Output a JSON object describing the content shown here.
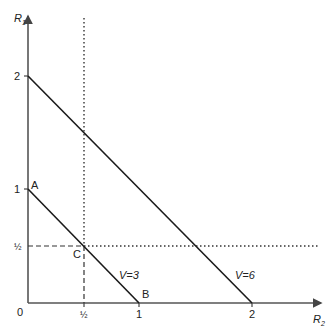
{
  "axes": {
    "y_label": "R",
    "y_label_sub": "1",
    "x_label": "R",
    "x_label_sub": "2",
    "origin_label": "0",
    "y_ticks": [
      {
        "label": "2",
        "value": 2
      },
      {
        "label": "1",
        "value": 1
      },
      {
        "label": "½",
        "value": 0.5
      }
    ],
    "x_ticks": [
      {
        "label": "½",
        "value": 0.5
      },
      {
        "label": "1",
        "value": 1
      },
      {
        "label": "2",
        "value": 2
      }
    ]
  },
  "lines": [
    {
      "name": "V=3",
      "label": "V=3",
      "from": [
        0,
        1
      ],
      "to": [
        1,
        0
      ]
    },
    {
      "name": "V=6",
      "label": "V=6",
      "from": [
        0,
        2
      ],
      "to": [
        2,
        0
      ]
    }
  ],
  "points": {
    "A": "A",
    "B": "B",
    "C": "C"
  },
  "guides": {
    "vertical_dotted_x": 0.5,
    "horizontal_dotted_y": 0.5
  },
  "colors": {
    "line": "#1a1a1a",
    "axis": "#555555",
    "text": "#222222"
  }
}
